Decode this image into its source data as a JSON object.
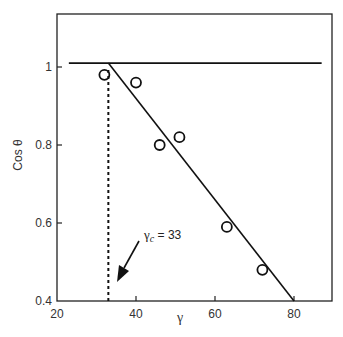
{
  "chart_data": {
    "type": "scatter",
    "title": "",
    "xlabel": "γ",
    "ylabel": "Cos θ",
    "xlim": [
      20,
      88
    ],
    "ylim": [
      0.4,
      1.15
    ],
    "x_ticks": [
      20,
      40,
      60,
      80
    ],
    "x_tick_labels": [
      "20",
      "40",
      "60",
      "80"
    ],
    "y_ticks": [
      0.4,
      0.6,
      0.8,
      1.0
    ],
    "y_tick_labels": [
      "0.4",
      "0.6",
      "0.8",
      "1"
    ],
    "grid": false,
    "legend": null,
    "series": [
      {
        "name": "data",
        "marker": "open-circle",
        "x": [
          32,
          40,
          46,
          51,
          63,
          72
        ],
        "y": [
          0.98,
          0.96,
          0.8,
          0.82,
          0.59,
          0.48
        ]
      }
    ],
    "lines": [
      {
        "name": "cos-theta-equals-1",
        "style": "solid",
        "x": [
          23,
          87
        ],
        "y": [
          1.01,
          1.01
        ]
      },
      {
        "name": "linear-fit",
        "style": "solid",
        "x": [
          33,
          80
        ],
        "y": [
          1.01,
          0.4
        ]
      },
      {
        "name": "critical-gamma",
        "style": "dashed",
        "x": [
          33,
          33
        ],
        "y": [
          0.4,
          1.0
        ]
      }
    ],
    "annotations": [
      {
        "text": "γc = 33",
        "symbol": "γ",
        "subscript": "c",
        "value_text": "= 33",
        "arrow_to": [
          34,
          0.43
        ]
      }
    ]
  }
}
